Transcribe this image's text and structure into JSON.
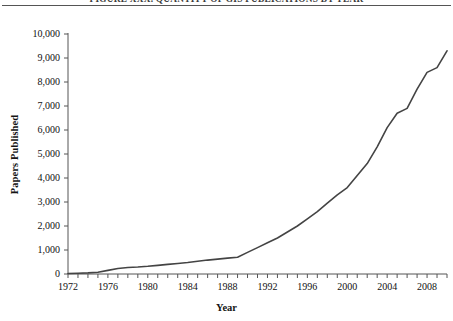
{
  "figure": {
    "title": "FIGURE XXX. QUANTITY OF GIS PUBLICATIONS BY YEAR",
    "rule_color": "#555555"
  },
  "chart_data": {
    "type": "line",
    "title": "FIGURE XXX. QUANTITY OF GIS PUBLICATIONS BY YEAR",
    "xlabel": "Year",
    "ylabel": "Papers Published",
    "xlim": [
      1972,
      2010
    ],
    "ylim": [
      0,
      10000
    ],
    "grid": false,
    "legend": "none",
    "line_color": "#444444",
    "line_width": 1.6,
    "x_tick_labels": [
      "1972",
      "1976",
      "1980",
      "1984",
      "1988",
      "1992",
      "1996",
      "2000",
      "2004",
      "2008"
    ],
    "x_tick_label_values": [
      1972,
      1976,
      1980,
      1984,
      1988,
      1992,
      1996,
      2000,
      2004,
      2008
    ],
    "x_minor_tick_interval": 1,
    "y_tick_labels": [
      "0",
      "1,000",
      "2,000",
      "3,000",
      "4,000",
      "5,000",
      "6,000",
      "7,000",
      "8,000",
      "9,000",
      "10,000"
    ],
    "y_tick_values": [
      0,
      1000,
      2000,
      3000,
      4000,
      5000,
      6000,
      7000,
      8000,
      9000,
      10000
    ],
    "x": [
      1972,
      1973,
      1974,
      1975,
      1976,
      1977,
      1978,
      1979,
      1980,
      1981,
      1982,
      1983,
      1984,
      1985,
      1986,
      1987,
      1988,
      1989,
      1990,
      1991,
      1992,
      1993,
      1994,
      1995,
      1996,
      1997,
      1998,
      1999,
      2000,
      2001,
      2002,
      2003,
      2004,
      2005,
      2006,
      2007,
      2008,
      2009,
      2010
    ],
    "values": [
      20,
      30,
      45,
      70,
      150,
      230,
      270,
      290,
      320,
      360,
      400,
      440,
      480,
      530,
      580,
      620,
      660,
      700,
      900,
      1100,
      1300,
      1500,
      1750,
      2000,
      2300,
      2600,
      2950,
      3300,
      3600,
      4100,
      4600,
      5300,
      6100,
      6700,
      6900,
      7700,
      8400,
      8600,
      9300
    ]
  }
}
